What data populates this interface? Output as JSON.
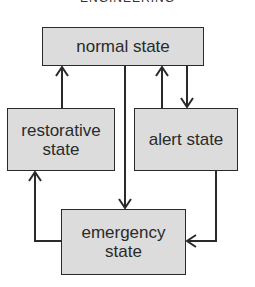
{
  "diagram": {
    "title": "ENGINEERING",
    "nodes": [
      {
        "id": "normal",
        "label": "normal state"
      },
      {
        "id": "restorative",
        "label": "restorative state"
      },
      {
        "id": "alert",
        "label": "alert state"
      },
      {
        "id": "emergency",
        "label": "emergency state"
      }
    ],
    "edges": [
      {
        "from": "restorative",
        "to": "normal"
      },
      {
        "from": "normal",
        "to": "emergency"
      },
      {
        "from": "alert",
        "to": "normal"
      },
      {
        "from": "normal",
        "to": "alert"
      },
      {
        "from": "alert",
        "to": "emergency"
      },
      {
        "from": "emergency",
        "to": "restorative"
      }
    ],
    "colors": {
      "box_fill": "#dcdcdc",
      "stroke": "#2a2a2a"
    }
  }
}
